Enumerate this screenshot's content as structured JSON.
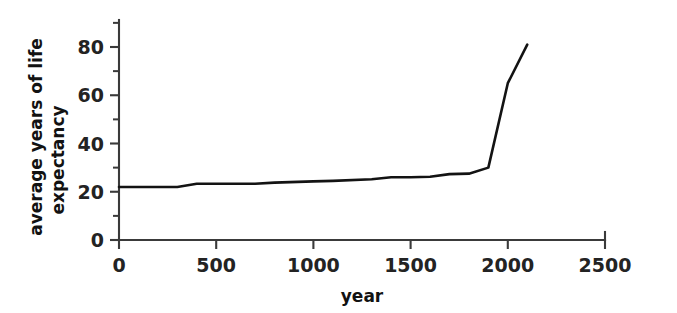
{
  "chart_data": {
    "type": "line",
    "title": "",
    "xlabel": "year",
    "ylabel_line1": "average years of life",
    "ylabel_line2": "expectancy",
    "ylabel": "average years of life expectancy",
    "xlim": [
      0,
      2500
    ],
    "ylim": [
      0,
      90
    ],
    "grid": false,
    "legend": "none",
    "x_ticks": [
      0,
      500,
      1000,
      1500,
      2000,
      2500
    ],
    "x_tick_labels": [
      "0",
      "500",
      "1000",
      "1500",
      "2000",
      "2500"
    ],
    "y_ticks": [
      0,
      20,
      40,
      60,
      80
    ],
    "y_tick_labels": [
      "0",
      "20",
      "40",
      "60",
      "80"
    ],
    "y_minor_ticks": [
      10,
      30,
      50,
      70,
      90
    ],
    "series": [
      {
        "name": "average life expectancy",
        "color": "#131313",
        "x": [
          0,
          300,
          400,
          700,
          800,
          1000,
          1100,
          1300,
          1400,
          1500,
          1600,
          1700,
          1800,
          1900,
          2000,
          2100
        ],
        "values": [
          22,
          22,
          23.3,
          23.3,
          23.8,
          24.3,
          24.5,
          25.2,
          26,
          26,
          26.2,
          27.3,
          27.5,
          30,
          65,
          81
        ]
      }
    ],
    "axis_color": "#3a3a3a",
    "line_color": "#131313",
    "background_color": "#ffffff"
  }
}
